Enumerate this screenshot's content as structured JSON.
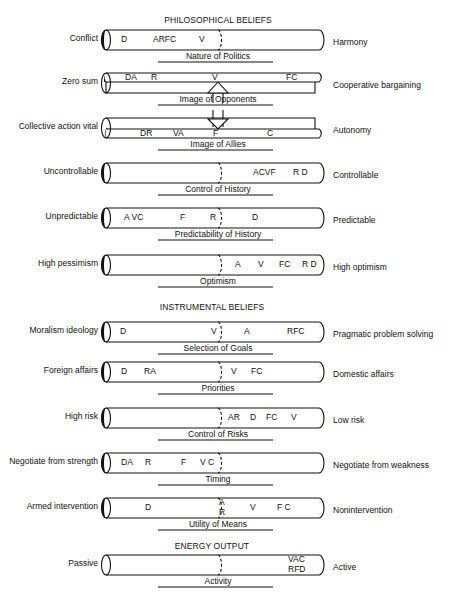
{
  "sections": [
    {
      "title": "PHILOSOPHICAL BELIEFS",
      "y": 15
    },
    {
      "title": "INSTRUMENTAL BELIEFS",
      "y": 302
    },
    {
      "title": "ENERGY OUTPUT",
      "y": 541
    }
  ],
  "legend_codes": [
    "A",
    "C",
    "D",
    "F",
    "R",
    "V"
  ],
  "scales": [
    {
      "id": "nature-of-politics",
      "dimension": "Nature of Politics",
      "left_pole": "Conflict",
      "right_pole": "Harmony",
      "y": 30,
      "style": "full",
      "shade": "dark",
      "marks": [
        {
          "text": "D",
          "x": 121
        },
        {
          "text": "ARFC",
          "x": 153
        },
        {
          "text": "V",
          "x": 199
        }
      ]
    },
    {
      "id": "image-of-opponents",
      "dimension": "Image of Opponents",
      "left_pole": "Zero sum",
      "right_pole": "Cooperative bargaining",
      "y": 73,
      "style": "split-top",
      "shade": "dark",
      "marks": [
        {
          "text": "DA",
          "x": 125
        },
        {
          "text": "R",
          "x": 151
        },
        {
          "text": "V",
          "x": 212
        },
        {
          "text": "FC",
          "x": 286
        }
      ]
    },
    {
      "id": "image-of-allies",
      "dimension": "Image of Allies",
      "left_pole": "Collective action vital",
      "right_pole": "Autonomy",
      "y": 118,
      "style": "split-bottom",
      "shade": "dark",
      "marks": [
        {
          "text": "DR",
          "x": 140
        },
        {
          "text": "VA",
          "x": 173
        },
        {
          "text": "F",
          "x": 213
        },
        {
          "text": "C",
          "x": 267
        }
      ]
    },
    {
      "id": "control-of-history",
      "dimension": "Control of History",
      "left_pole": "Uncontrollable",
      "right_pole": "Controllable",
      "y": 163,
      "style": "full",
      "shade": "dark",
      "marks": [
        {
          "text": "ACVF",
          "x": 253
        },
        {
          "text": "R D",
          "x": 293
        }
      ]
    },
    {
      "id": "predictability-of-history",
      "dimension": "Predictability of History",
      "left_pole": "Unpredictable",
      "right_pole": "Predictable",
      "y": 208,
      "style": "full",
      "shade": "dark",
      "marks": [
        {
          "text": "A VC",
          "x": 124
        },
        {
          "text": "F",
          "x": 180
        },
        {
          "text": "R",
          "x": 210
        },
        {
          "text": "D",
          "x": 252
        }
      ]
    },
    {
      "id": "optimism",
      "dimension": "Optimism",
      "left_pole": "High pessimism",
      "right_pole": "High optimism",
      "y": 255,
      "style": "full",
      "shade": "dark",
      "marks": [
        {
          "text": "A",
          "x": 235
        },
        {
          "text": "V",
          "x": 258
        },
        {
          "text": "FC",
          "x": 279
        },
        {
          "text": "R D",
          "x": 302
        }
      ]
    },
    {
      "id": "selection-of-goals",
      "dimension": "Selection of Goals",
      "left_pole": "Moralism ideology",
      "right_pole": "Pragmatic problem solving",
      "y": 322,
      "style": "full",
      "shade": "dark",
      "marks": [
        {
          "text": "D",
          "x": 120
        },
        {
          "text": "V",
          "x": 211
        },
        {
          "text": "A",
          "x": 244
        },
        {
          "text": "RFC",
          "x": 287
        }
      ]
    },
    {
      "id": "priorities",
      "dimension": "Priorities",
      "left_pole": "Foreign affairs",
      "right_pole": "Domestic affairs",
      "y": 362,
      "style": "full",
      "shade": "dark",
      "marks": [
        {
          "text": "D",
          "x": 121
        },
        {
          "text": "RA",
          "x": 144
        },
        {
          "text": "V",
          "x": 231
        },
        {
          "text": "FC",
          "x": 251
        }
      ]
    },
    {
      "id": "control-of-risks",
      "dimension": "Control of Risks",
      "left_pole": "High risk",
      "right_pole": "Low risk",
      "y": 408,
      "style": "full",
      "shade": "dark",
      "marks": [
        {
          "text": "AR",
          "x": 228
        },
        {
          "text": "D",
          "x": 250
        },
        {
          "text": "FC",
          "x": 266
        },
        {
          "text": "V",
          "x": 291
        }
      ]
    },
    {
      "id": "timing",
      "dimension": "Timing",
      "left_pole": "Negotiate from strength",
      "right_pole": "Negotiate from weakness",
      "y": 453,
      "style": "full",
      "shade": "dark",
      "marks": [
        {
          "text": "DA",
          "x": 121
        },
        {
          "text": "R",
          "x": 145
        },
        {
          "text": "F",
          "x": 181
        },
        {
          "text": "V C",
          "x": 200
        }
      ]
    },
    {
      "id": "utility-of-means",
      "dimension": "Utility of Means",
      "left_pole": "Armed intervention",
      "right_pole": "Nonintervention",
      "y": 498,
      "style": "full",
      "shade": "dark",
      "marks": [
        {
          "text": "D",
          "x": 145
        },
        {
          "text": "A",
          "x": 219,
          "dy": -5
        },
        {
          "text": "R",
          "x": 219,
          "dy": 5
        },
        {
          "text": "V",
          "x": 250
        },
        {
          "text": "F C",
          "x": 277
        }
      ]
    },
    {
      "id": "activity",
      "dimension": "Activity",
      "left_pole": "Passive",
      "right_pole": "Active",
      "y": 555,
      "style": "full",
      "shade": "none",
      "marks": [
        {
          "text": "VAC",
          "x": 288,
          "dy": -5
        },
        {
          "text": "RFD",
          "x": 288,
          "dy": 5
        }
      ]
    }
  ]
}
